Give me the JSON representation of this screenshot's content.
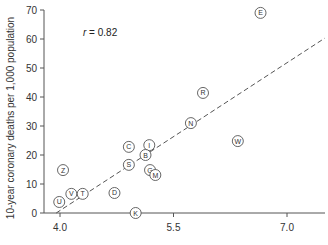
{
  "chart_data": {
    "type": "scatter",
    "title": "",
    "xlabel": "",
    "ylabel": "10-year coronary deaths per 1,000 population",
    "xlim": [
      3.8,
      7.5
    ],
    "ylim": [
      0,
      70
    ],
    "x_ticks": [
      4.0,
      5.5,
      7.0
    ],
    "x_tick_labels": [
      "4.0",
      "5.5",
      "7.0"
    ],
    "y_ticks": [
      0,
      10,
      20,
      30,
      40,
      50,
      60,
      70
    ],
    "y_tick_labels": [
      "0",
      "10",
      "20",
      "30",
      "40",
      "50",
      "60",
      "70"
    ],
    "grid": false,
    "legend": null,
    "annotation": {
      "text_italic": "r",
      "text_rest": " = 0.82"
    },
    "trend_line": {
      "style": "dashed",
      "x0": 3.95,
      "y0": 0,
      "x1": 7.5,
      "y1": 60.3
    },
    "points": [
      {
        "label": "E",
        "x": 6.65,
        "y": 69.0
      },
      {
        "label": "R",
        "x": 5.89,
        "y": 41.4
      },
      {
        "label": "N",
        "x": 5.73,
        "y": 31.0
      },
      {
        "label": "W",
        "x": 6.35,
        "y": 24.8
      },
      {
        "label": "C",
        "x": 4.91,
        "y": 22.8
      },
      {
        "label": "I",
        "x": 5.18,
        "y": 23.4
      },
      {
        "label": "B",
        "x": 5.13,
        "y": 20.0
      },
      {
        "label": "S",
        "x": 4.91,
        "y": 16.6
      },
      {
        "label": "G",
        "x": 5.19,
        "y": 14.8
      },
      {
        "label": "M",
        "x": 5.26,
        "y": 13.1
      },
      {
        "label": "Z",
        "x": 4.04,
        "y": 14.8
      },
      {
        "label": "U",
        "x": 3.99,
        "y": 3.8
      },
      {
        "label": "V",
        "x": 4.15,
        "y": 6.6
      },
      {
        "label": "T",
        "x": 4.3,
        "y": 6.6
      },
      {
        "label": "D",
        "x": 4.72,
        "y": 6.9
      },
      {
        "label": "K",
        "x": 5.0,
        "y": 0.0
      }
    ]
  },
  "colors": {
    "axis": "#555555",
    "marker_stroke": "#555555",
    "marker_fill": "#ffffff",
    "trend": "#555555",
    "text": "#333333"
  }
}
